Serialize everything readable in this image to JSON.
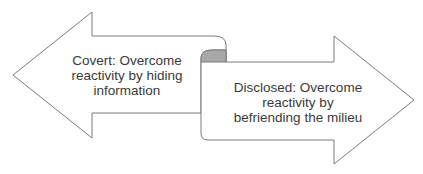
{
  "diagram": {
    "type": "double-arrow-scroll",
    "left_arrow": {
      "direction": "left",
      "lines": [
        "Covert: Overcome",
        "reactivity by hiding",
        "information"
      ],
      "text": "Covert: Overcome reactivity by hiding information"
    },
    "right_arrow": {
      "direction": "right",
      "lines": [
        "Disclosed: Overcome",
        "reactivity by",
        "befriending the milieu"
      ],
      "text": "Disclosed: Overcome reactivity by befriending the milieu"
    },
    "colors": {
      "stroke": "#7a7a7a",
      "fill": "#ffffff",
      "curl_fill": "#a8a8a8",
      "text": "#3a3a3a"
    }
  }
}
